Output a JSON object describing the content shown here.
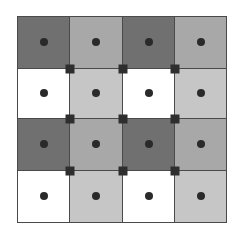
{
  "diagram": {
    "type": "grid",
    "rows": 4,
    "cols": 4,
    "colors": {
      "dark": "#707070",
      "medium": "#a8a8a8",
      "light": "#c6c6c6",
      "white": "#ffffff",
      "dot": "#2a2a2a",
      "marker": "#2e2e2e",
      "line": "#4a4a4a"
    },
    "cells": [
      [
        "dark",
        "medium",
        "dark",
        "medium"
      ],
      [
        "white",
        "light",
        "white",
        "light"
      ],
      [
        "dark",
        "medium",
        "dark",
        "medium"
      ],
      [
        "white",
        "light",
        "white",
        "light"
      ]
    ],
    "col_edges": [
      17,
      69,
      122,
      174,
      226
    ],
    "row_edges": [
      16,
      68,
      118,
      170,
      222
    ],
    "cell_center_dots": true,
    "intersection_markers": true
  }
}
